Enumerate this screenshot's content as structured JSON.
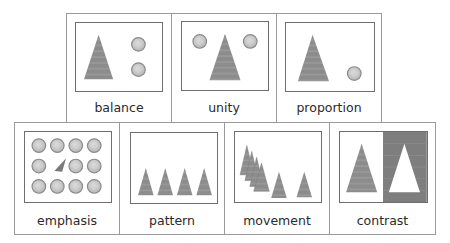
{
  "colors": {
    "triangle_fill": "#8c8c8c",
    "triangle_stripe": "#a8a8a8",
    "circle_fill": "#c8c8c8",
    "circle_stroke": "#8a8a8a",
    "cell_border": "#9a9a9a",
    "frame_border": "#6e6e6e",
    "contrast_dark": "#7e7e7e"
  },
  "cards": [
    {
      "id": "balance",
      "label": "balance",
      "row": 1
    },
    {
      "id": "unity",
      "label": "unity",
      "row": 1
    },
    {
      "id": "proportion",
      "label": "proportion",
      "row": 1
    },
    {
      "id": "emphasis",
      "label": "emphasis",
      "row": 2
    },
    {
      "id": "pattern",
      "label": "pattern",
      "row": 2
    },
    {
      "id": "movement",
      "label": "movement",
      "row": 2
    },
    {
      "id": "contrast",
      "label": "contrast",
      "row": 2
    }
  ]
}
